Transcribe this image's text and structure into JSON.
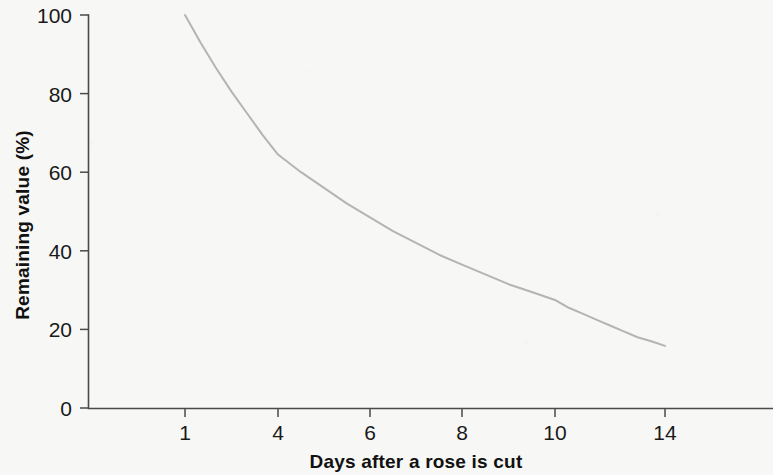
{
  "chart_data": {
    "type": "line",
    "title": "",
    "subtitle": "",
    "xlabel": "Days after a rose is cut",
    "ylabel": "Remaining value (%)",
    "xlim": [
      0.4,
      14.8
    ],
    "ylim": [
      0,
      100
    ],
    "grid": false,
    "legend": null,
    "x_tick_labels": [
      "1",
      "4",
      "6",
      "8",
      "10",
      "14"
    ],
    "x_tick_values": [
      1,
      4,
      6,
      8,
      10,
      14
    ],
    "y_tick_labels": [
      "0",
      "20",
      "40",
      "60",
      "80",
      "100"
    ],
    "y_tick_values": [
      0,
      20,
      40,
      60,
      80,
      100
    ],
    "series": [
      {
        "name": "Remaining value",
        "color": "#b4b4b4",
        "x": [
          1,
          1.5,
          2,
          2.5,
          3,
          3.5,
          4,
          4.5,
          5,
          5.5,
          6,
          6.5,
          7,
          7.5,
          8,
          8.5,
          9,
          9.5,
          10,
          10.5,
          11,
          11.5,
          12,
          12.5,
          13,
          13.5,
          14
        ],
        "values": [
          100,
          93,
          86.5,
          80.5,
          75,
          69.5,
          64.5,
          60,
          56,
          52,
          48.5,
          45,
          42,
          39,
          36.5,
          34,
          31.5,
          29.5,
          27.5,
          25.5,
          24,
          22.5,
          21,
          19.5,
          18,
          17,
          15.8
        ]
      }
    ],
    "annotations": []
  },
  "axes": {
    "y_axis_title": "Remaining value (%)",
    "x_axis_title": "Days after a rose is cut"
  },
  "colors": {
    "background": "#f7f7f5",
    "axis": "#4a4a4a",
    "curve": "#b4b4b4",
    "text": "#1a1a1a"
  }
}
